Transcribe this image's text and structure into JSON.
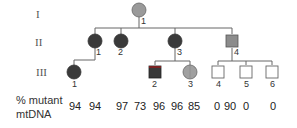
{
  "generations": [
    {
      "label": "I"
    },
    {
      "label": "II"
    },
    {
      "label": "III"
    }
  ],
  "individuals": [
    {
      "gen": "I",
      "num": "1",
      "sex": "female",
      "affected": "partial",
      "fill": "#9a9a9a",
      "mutant_pct": "94"
    },
    {
      "gen": "II",
      "num": "1",
      "sex": "female",
      "affected": "full",
      "fill": "#3a3a3a",
      "mutant_pct": "94"
    },
    {
      "gen": "II",
      "num": "2",
      "sex": "female",
      "affected": "full",
      "fill": "#3a3a3a",
      "mutant_pct": "97"
    },
    {
      "gen": "II",
      "num": "3",
      "sex": "female",
      "affected": "full",
      "fill": "#3a3a3a",
      "mutant_pct": "96"
    },
    {
      "gen": "II",
      "num": "4",
      "sex": "male",
      "affected": "partial",
      "fill": "#8c8c8c",
      "mutant_pct": "90"
    },
    {
      "gen": "III",
      "num": "1",
      "sex": "female",
      "affected": "full",
      "fill": "#3a3a3a",
      "mutant_pct": "73"
    },
    {
      "gen": "III",
      "num": "2",
      "sex": "male",
      "affected": "full",
      "fill": "#3a3a3a",
      "mutant_pct": "96"
    },
    {
      "gen": "III",
      "num": "3",
      "sex": "female",
      "affected": "partial",
      "fill": "#a0a0a0",
      "mutant_pct": "85"
    },
    {
      "gen": "III",
      "num": "4",
      "sex": "male",
      "affected": "none",
      "fill": "#ffffff",
      "mutant_pct": "0"
    },
    {
      "gen": "III",
      "num": "5",
      "sex": "male",
      "affected": "none",
      "fill": "#ffffff",
      "mutant_pct": "0"
    },
    {
      "gen": "III",
      "num": "6",
      "sex": "male",
      "affected": "none",
      "fill": "#ffffff",
      "mutant_pct": "0"
    }
  ],
  "mtdna_row": {
    "label_line1": "% mutant",
    "label_line2": "mtDNA",
    "values": [
      "94",
      "94",
      "97",
      "73",
      "96",
      "96",
      "85",
      "0",
      "90",
      "0",
      "0"
    ]
  },
  "colors": {
    "affected": "#3a3a3a",
    "partial": "#9a9a9a",
    "unaffected": "#ffffff",
    "line": "#666666"
  }
}
